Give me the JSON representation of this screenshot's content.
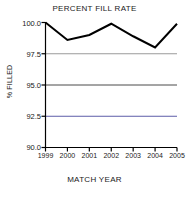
{
  "chart_data": {
    "type": "line",
    "title": "PERCENT FILL RATE",
    "xlabel": "MATCH YEAR",
    "ylabel": "% FILLED",
    "categories": [
      "1999",
      "2000",
      "2001",
      "2002",
      "2003",
      "2004",
      "2005"
    ],
    "x": [
      1999,
      2000,
      2001,
      2002,
      2003,
      2004,
      2005
    ],
    "values": [
      100.0,
      98.6,
      99.0,
      99.9,
      98.9,
      98.0,
      99.9
    ],
    "series": [
      {
        "name": "Percent Fill Rate",
        "values": [
          100.0,
          98.6,
          99.0,
          99.9,
          98.9,
          98.0,
          99.9
        ]
      }
    ],
    "ylim": [
      90.0,
      100.0
    ],
    "yticks": [
      100.0,
      97.5,
      95.0,
      92.5,
      90.0
    ],
    "ytick_labels": [
      "100.0",
      "97.5",
      "95.0",
      "92.5",
      "90.0"
    ],
    "xtick_labels": [
      "1999",
      "2000",
      "2001",
      "2002",
      "2003",
      "2004",
      "2005"
    ],
    "grid": true,
    "grid_axis": "y",
    "legend": false,
    "line_color": "#000000",
    "line_width": 2,
    "grid_color": "#555555",
    "axis_color": "#000000",
    "background_color": "#ffffff"
  },
  "axes": {
    "y_ticks": [
      {
        "label": "100.0"
      },
      {
        "label": "97.5"
      },
      {
        "label": "95.0"
      },
      {
        "label": "92.5"
      },
      {
        "label": "90.0"
      }
    ],
    "x_ticks": [
      {
        "label": "1999"
      },
      {
        "label": "2000"
      },
      {
        "label": "2001"
      },
      {
        "label": "2002"
      },
      {
        "label": "2003"
      },
      {
        "label": "2004"
      },
      {
        "label": "2005"
      }
    ]
  }
}
